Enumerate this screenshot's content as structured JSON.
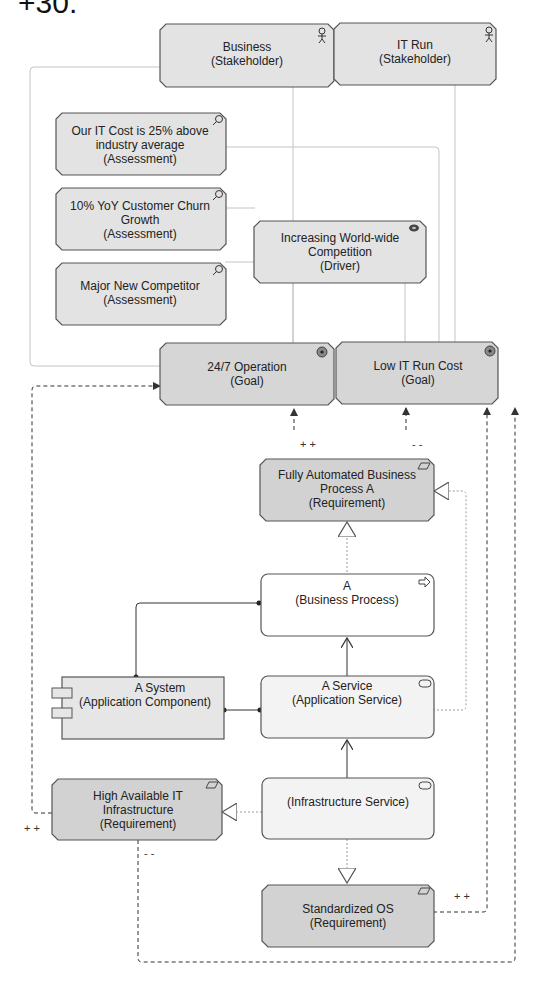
{
  "page": {
    "cut_title": "+30."
  },
  "colors": {
    "motivation_fill": "#e3e3e3",
    "goal_fill": "#d6d6d6",
    "requirement_fill": "#d2d2d2",
    "process_fill": "#ffffff",
    "service_fill": "#f3f3f3",
    "component_fill": "#e6e6e6",
    "stroke": "#4a4a4a",
    "light_line": "#bdbdbd"
  },
  "nodes": {
    "business": {
      "line1": "Business",
      "line2": "(Stakeholder)",
      "icon": "actor-icon"
    },
    "it_run": {
      "line1": "IT Run",
      "line2": "(Stakeholder)",
      "icon": "actor-icon"
    },
    "it_cost": {
      "line1": "Our IT Cost is 25% above",
      "line2": "industry average",
      "line3": "(Assessment)",
      "icon": "magnifier-icon"
    },
    "churn": {
      "line1": "10% YoY Customer Churn",
      "line2": "Growth",
      "line3": "(Assessment)",
      "icon": "magnifier-icon"
    },
    "competitor": {
      "line1": "Major New Competitor",
      "line2": "(Assessment)",
      "icon": "magnifier-icon"
    },
    "driver": {
      "line1": "Increasing World-wide",
      "line2": "Competition",
      "line3": "(Driver)",
      "icon": "driver-icon"
    },
    "goal_247": {
      "line1": "24/7 Operation",
      "line2": "(Goal)",
      "icon": "target-icon"
    },
    "goal_cost": {
      "line1": "Low IT Run Cost",
      "line2": "(Goal)",
      "icon": "target-icon"
    },
    "req_auto": {
      "line1": "Fully Automated Business",
      "line2": "Process A",
      "line3": "(Requirement)",
      "icon": "parallelogram-icon"
    },
    "process_a": {
      "line1": "A",
      "line2": "(Business Process)",
      "icon": "arrow-icon"
    },
    "system": {
      "line1": "A System",
      "line2": "(Application Component)",
      "icon": "component-icon"
    },
    "app_service": {
      "line1": "A Service",
      "line2": "(Application Service)",
      "icon": "service-icon"
    },
    "req_ha": {
      "line1": "High Available IT",
      "line2": "Infrastructure",
      "line3": "(Requirement)",
      "icon": "parallelogram-icon"
    },
    "infra_service": {
      "line1": "(Infrastructure Service)",
      "icon": "service-icon"
    },
    "req_os": {
      "line1": "Standardized OS",
      "line2": "(Requirement)",
      "icon": "parallelogram-icon"
    }
  },
  "influence_labels": {
    "auto_to_247": "+ +",
    "auto_to_cost": "- -",
    "ha_to_247": "+ +",
    "ha_to_cost": "- -",
    "os_to_cost": "+ +"
  }
}
